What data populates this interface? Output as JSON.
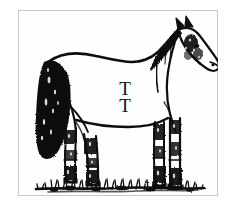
{
  "image": {
    "title": "Horse with TT brand",
    "subject": "horse",
    "style": "black-and-white pen-and-ink line drawing",
    "background_color": "#ffffff",
    "ink_color": "#111111",
    "border_color": "#c9c9c9",
    "frame": {
      "x": 18,
      "y": 10,
      "width": 200,
      "height": 186
    }
  },
  "brand": {
    "letters": [
      "T",
      "T"
    ],
    "description": "two stacked serif capital T letters branded on the horse's barrel",
    "color": "#111111"
  },
  "scene": {
    "ground_label": "grass tufts",
    "horse_label": "standing horse in profile facing right",
    "parts": [
      "head",
      "ear",
      "muzzle",
      "mane",
      "neck",
      "withers",
      "back",
      "rump",
      "tail",
      "belly",
      "foreleg-near",
      "foreleg-far",
      "hindleg-near",
      "hindleg-far",
      "hoof"
    ]
  }
}
